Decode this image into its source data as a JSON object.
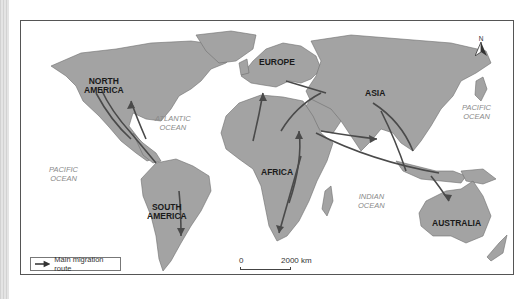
{
  "map": {
    "title": "",
    "land_color": "#a3a3a3",
    "border_color": "#666666",
    "route_color": "#4a4a4a",
    "ocean_color": "#ffffff",
    "continents": [
      {
        "id": "north-america",
        "label_line1": "NORTH",
        "label_line2": "AMERICA"
      },
      {
        "id": "south-america",
        "label_line1": "SOUTH",
        "label_line2": "AMERICA"
      },
      {
        "id": "europe",
        "label_line1": "EUROPE",
        "label_line2": ""
      },
      {
        "id": "africa",
        "label_line1": "AFRICA",
        "label_line2": ""
      },
      {
        "id": "asia",
        "label_line1": "ASIA",
        "label_line2": ""
      },
      {
        "id": "australia",
        "label_line1": "AUSTRALIA",
        "label_line2": ""
      }
    ],
    "oceans": [
      {
        "id": "atlantic",
        "label_line1": "ATLANTIC",
        "label_line2": "OCEAN"
      },
      {
        "id": "pacific-west",
        "label_line1": "PACIFIC",
        "label_line2": "OCEAN"
      },
      {
        "id": "pacific-east",
        "label_line1": "PACIFIC",
        "label_line2": "OCEAN"
      },
      {
        "id": "indian",
        "label_line1": "INDIAN",
        "label_line2": "OCEAN"
      }
    ],
    "legend": {
      "label": "Main migration route",
      "icon": "arrow-right-icon"
    },
    "scale": {
      "zero": "0",
      "max": "2000 km"
    },
    "north_arrow": {
      "label": "N",
      "icon": "north-arrow-icon"
    }
  }
}
